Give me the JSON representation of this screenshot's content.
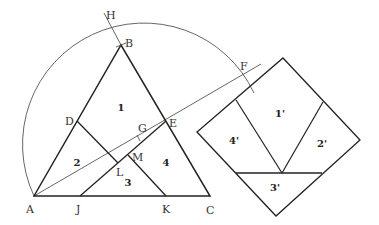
{
  "diagram": {
    "points": [
      {
        "id": "A",
        "label": "A",
        "x": 34,
        "y": 196,
        "lx": 26,
        "ly": 213
      },
      {
        "id": "B",
        "label": "B",
        "x": 121,
        "y": 45,
        "lx": 125,
        "ly": 47
      },
      {
        "id": "C",
        "label": "C",
        "x": 210,
        "y": 196,
        "lx": 206,
        "ly": 214
      },
      {
        "id": "D",
        "label": "D",
        "x": 77,
        "y": 121,
        "lx": 65,
        "ly": 125
      },
      {
        "id": "E",
        "label": "E",
        "x": 166,
        "y": 121,
        "lx": 169,
        "ly": 127
      },
      {
        "id": "F",
        "label": "F",
        "x": 241,
        "y": 74,
        "lx": 240,
        "ly": 70
      },
      {
        "id": "G",
        "label": "G",
        "x": 139,
        "y": 138,
        "lx": 138,
        "ly": 132
      },
      {
        "id": "H",
        "label": "H",
        "x": 108,
        "y": 20,
        "lx": 106,
        "ly": 19
      },
      {
        "id": "J",
        "label": "J",
        "x": 80,
        "y": 196,
        "lx": 76,
        "ly": 213
      },
      {
        "id": "K",
        "label": "K",
        "x": 166,
        "y": 196,
        "lx": 162,
        "ly": 213
      },
      {
        "id": "L",
        "label": "L",
        "x": 118,
        "y": 163,
        "lx": 116,
        "ly": 176
      },
      {
        "id": "M",
        "label": "M",
        "x": 128,
        "y": 155,
        "lx": 132,
        "ly": 161
      }
    ],
    "pieces_triangle": [
      {
        "label": "1",
        "x": 121,
        "y": 111
      },
      {
        "label": "2",
        "x": 77,
        "y": 166
      },
      {
        "label": "3",
        "x": 128,
        "y": 186
      },
      {
        "label": "4",
        "x": 166,
        "y": 166
      }
    ],
    "pieces_square": [
      {
        "label": "1'",
        "x": 280,
        "y": 117
      },
      {
        "label": "2'",
        "x": 322,
        "y": 147
      },
      {
        "label": "3'",
        "x": 275,
        "y": 191
      },
      {
        "label": "4'",
        "x": 234,
        "y": 144
      }
    ]
  }
}
